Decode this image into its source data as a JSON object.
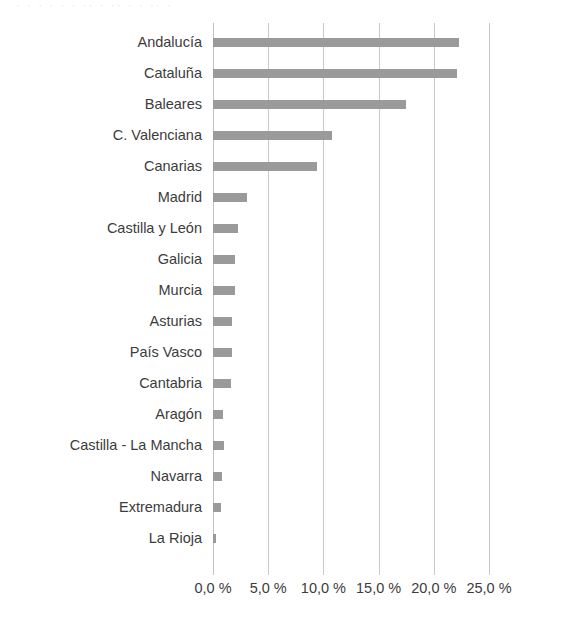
{
  "chart_data": {
    "type": "bar",
    "orientation": "horizontal",
    "title": "",
    "subtitle": "",
    "xlabel": "",
    "ylabel": "",
    "xlim": [
      0,
      25
    ],
    "ylim": null,
    "grid": "vertical",
    "legend": null,
    "bar_color": "#9a9a9a",
    "gridline_color": "#c9c9c9",
    "background_color": "#ffffff",
    "value_suffix": " %",
    "decimal_separator": ",",
    "xticks": [
      0,
      5,
      10,
      15,
      20,
      25
    ],
    "xtick_labels": [
      "0,0 %",
      "5,0 %",
      "10,0 %",
      "15,0 %",
      "20,0 %",
      "25,0 %"
    ],
    "categories": [
      "Andalucía",
      "Cataluña",
      "Baleares",
      "C. Valenciana",
      "Canarias",
      "Madrid",
      "Castilla y León",
      "Galicia",
      "Murcia",
      "Asturias",
      "País Vasco",
      "Cantabria",
      "Aragón",
      "Castilla - La Mancha",
      "Navarra",
      "Extremadura",
      "La Rioja"
    ],
    "values": [
      22.3,
      22.1,
      17.5,
      10.8,
      9.4,
      3.1,
      2.3,
      2.0,
      2.0,
      1.7,
      1.7,
      1.6,
      0.9,
      1.0,
      0.8,
      0.7,
      0.3
    ]
  },
  "top_remnant": "· · · ·   · ·   ·· ·   ·· ·   · ·· ·"
}
